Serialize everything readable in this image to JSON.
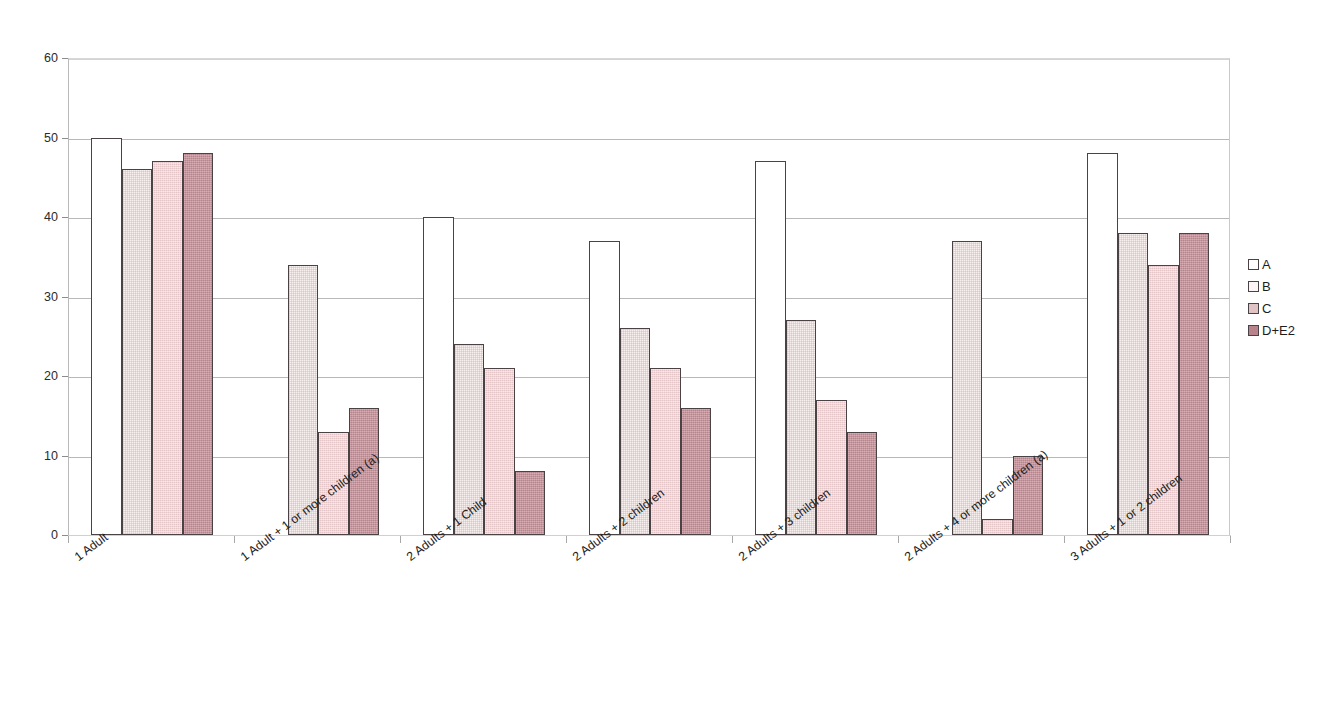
{
  "chart_data": {
    "type": "bar",
    "title": "",
    "subtitle": "",
    "xlabel": "",
    "ylabel": "",
    "ylim": [
      0,
      60
    ],
    "y_ticks": [
      0,
      10,
      20,
      30,
      40,
      50,
      60
    ],
    "grid": true,
    "legend_position": "right",
    "grouping": "grouped",
    "categories": [
      "1 Adult",
      "1 Adult + 1 or more children (a)",
      "2 Adults + 1 Child",
      "2 Adults + 2 children",
      "2 Adults + 3 children",
      "2 Adults + 4 or more children (a)",
      "3 Adults + 1 or 2 children"
    ],
    "series": [
      {
        "name": "A",
        "color": "#ffffff",
        "values": [
          50,
          null,
          40,
          37,
          47,
          null,
          48
        ]
      },
      {
        "name": "B",
        "color": "#f7f0ef",
        "values": [
          46,
          34,
          24,
          26,
          27,
          37,
          38
        ]
      },
      {
        "name": "C",
        "color": "#e3c5c7",
        "values": [
          47,
          13,
          21,
          21,
          17,
          2,
          34
        ]
      },
      {
        "name": "D+E2",
        "color": "#b9838c",
        "values": [
          48,
          16,
          8,
          16,
          13,
          10,
          38
        ]
      }
    ],
    "annotations": []
  },
  "legend": {
    "items": [
      {
        "label": "A",
        "series_key": "A"
      },
      {
        "label": "B",
        "series_key": "B"
      },
      {
        "label": "C",
        "series_key": "C"
      },
      {
        "label": "D+E2",
        "series_key": "D"
      }
    ]
  },
  "colors": {
    "series_a": "#ffffff",
    "series_b": "#f7f0ef",
    "series_c": "#e3c5c7",
    "series_d_e2": "#b9838c",
    "bar_outline": "#4a4244",
    "gridline": "#b8b8b8",
    "axis": "#8c8c8c",
    "text": "#222222",
    "background": "#ffffff"
  }
}
